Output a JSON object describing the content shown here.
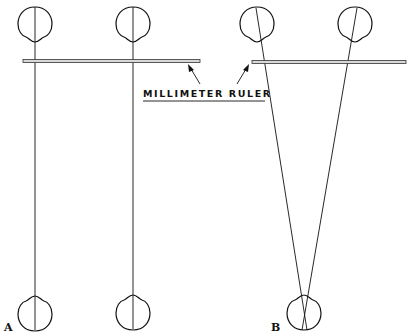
{
  "figure": {
    "annotation": {
      "label": "MILLIMETER RULER",
      "arrows_point_to": [
        "ruler-a",
        "ruler-b"
      ]
    },
    "panels": [
      {
        "letter": "A",
        "description": "Parallel viewing lines: each top eye aligned vertically with a bottom eye",
        "top_eyes": 2,
        "bottom_eyes": 2,
        "lines": "parallel"
      },
      {
        "letter": "B",
        "description": "Converging viewing lines: both top eyes lines cross at a single bottom eye",
        "top_eyes": 2,
        "bottom_eyes": 1,
        "lines": "converging"
      }
    ]
  },
  "colors": {
    "ink": "#111111",
    "ruler_fill": "#d8d8d8",
    "background": "#ffffff"
  }
}
